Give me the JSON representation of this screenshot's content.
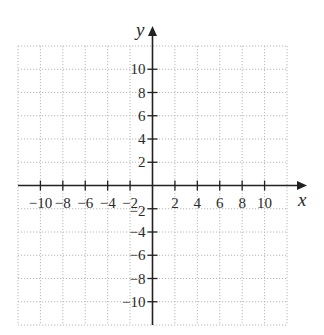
{
  "chart_data": {
    "type": "scatter",
    "title": "",
    "xlabel": "x",
    "ylabel": "y",
    "xlim": [
      -12,
      12
    ],
    "ylim": [
      -12,
      12
    ],
    "grid": true,
    "grid_style": "dotted",
    "grid_step": 2,
    "x_ticks": [
      -10,
      -8,
      -6,
      -4,
      -2,
      2,
      4,
      6,
      8,
      10
    ],
    "y_ticks": [
      -10,
      -8,
      -6,
      -4,
      -2,
      2,
      4,
      6,
      8,
      10
    ],
    "x_tick_labels": [
      "−10",
      "−8",
      "−6",
      "−4",
      "−2",
      "2",
      "4",
      "6",
      "8",
      "10"
    ],
    "y_tick_labels": [
      "−10",
      "−8",
      "−6",
      "−4",
      "−2",
      "2",
      "4",
      "6",
      "8",
      "10"
    ],
    "series": [],
    "colors": {
      "axis": "#222222",
      "grid": "#b8b8b8",
      "text": "#2a2a2a"
    }
  }
}
